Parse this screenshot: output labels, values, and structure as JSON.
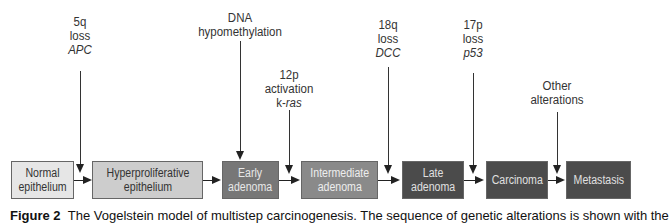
{
  "diagram": {
    "type": "linear-flow",
    "stages": [
      {
        "id": "normal",
        "line1": "Normal",
        "line2": "epithelium",
        "fill": "#e6e6e6",
        "text_color": "#333333"
      },
      {
        "id": "hyperproliferative",
        "line1": "Hyperproliferative",
        "line2": "epithelium",
        "fill": "#cdcdcd",
        "text_color": "#333333"
      },
      {
        "id": "early-adenoma",
        "line1": "Early",
        "line2": "adenoma",
        "fill": "#777777",
        "text_color": "#e8e8e8"
      },
      {
        "id": "intermediate-adenoma",
        "line1": "Intermediate",
        "line2": "adenoma",
        "fill": "#8a8a8a",
        "text_color": "#eeeeee"
      },
      {
        "id": "late-adenoma",
        "line1": "Late",
        "line2": "adenoma",
        "fill": "#4b4b4b",
        "text_color": "#e0e0e0"
      },
      {
        "id": "carcinoma",
        "line1": "Carcinoma",
        "line2": "",
        "fill": "#4b4b4b",
        "text_color": "#e0e0e0"
      },
      {
        "id": "metastasis",
        "line1": "Metastasis",
        "line2": "",
        "fill": "#4b4b4b",
        "text_color": "#e0e0e0"
      }
    ],
    "alterations": [
      {
        "id": "apc",
        "lines": [
          "5q",
          "loss"
        ],
        "gene": "APC",
        "target": "normal-to-hyperproliferative"
      },
      {
        "id": "dna-hypomethylation",
        "lines": [
          "DNA",
          "hypomethylation"
        ],
        "gene": "",
        "target": "hyperproliferative-to-early-adenoma"
      },
      {
        "id": "kras",
        "lines": [
          "12p",
          "activation"
        ],
        "gene_prefix": "k-",
        "gene": "ras",
        "target": "early-to-intermediate-adenoma"
      },
      {
        "id": "dcc",
        "lines": [
          "18q",
          "loss"
        ],
        "gene": "DCC",
        "target": "intermediate-to-late-adenoma"
      },
      {
        "id": "p53",
        "lines": [
          "17p",
          "loss"
        ],
        "gene": "p53",
        "target": "late-adenoma-to-carcinoma"
      },
      {
        "id": "other",
        "lines": [
          "Other",
          "alterations"
        ],
        "gene": "",
        "target": "carcinoma-to-metastasis"
      }
    ]
  },
  "caption": {
    "label": "Figure 2",
    "text": "The Vogelstein model of multistep carcinogenesis. The sequence of genetic alterations is shown with the"
  }
}
